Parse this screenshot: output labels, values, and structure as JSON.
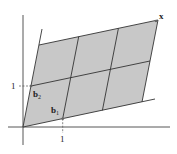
{
  "diagram": {
    "type": "lattice-parallelogram",
    "origin_px": [
      23,
      127
    ],
    "b1_px": [
      39.7,
      -8.3
    ],
    "b2_px": [
      8,
      -41
    ],
    "grid": {
      "cols": 3,
      "rows": 2
    },
    "fill_color": "#c8c8c8",
    "line_color": "#333333",
    "axis_color": "#444444",
    "labels": {
      "x_tick": "1",
      "y_tick": "1",
      "b1": "b",
      "b1_sub": "1",
      "b2": "b",
      "b2_sub": "2",
      "point": "x"
    }
  }
}
